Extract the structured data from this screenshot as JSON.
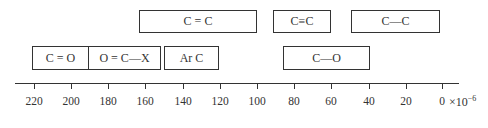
{
  "diagram": {
    "title": "",
    "boxes": [
      {
        "label": "C = C",
        "from": 160,
        "to": 100,
        "row": 1
      },
      {
        "label": "C≡C",
        "from": 92,
        "to": 61,
        "row": 1
      },
      {
        "label": "C—C",
        "from": 49,
        "to": 2,
        "row": 1
      },
      {
        "label": "C = O",
        "from": 221,
        "to": 191,
        "row": 2
      },
      {
        "label": "O = C—X",
        "from": 191,
        "to": 152,
        "row": 2
      },
      {
        "label": "Ar C",
        "from": 150,
        "to": 121,
        "row": 2
      },
      {
        "label": "C—O",
        "from": 86,
        "to": 40,
        "row": 2
      }
    ],
    "axis": {
      "ticks": [
        "220",
        "200",
        "180",
        "160",
        "140",
        "120",
        "100",
        "80",
        "60",
        "40",
        "20",
        "0"
      ],
      "unit_prefix": "×10",
      "unit_exponent": "−6"
    }
  }
}
